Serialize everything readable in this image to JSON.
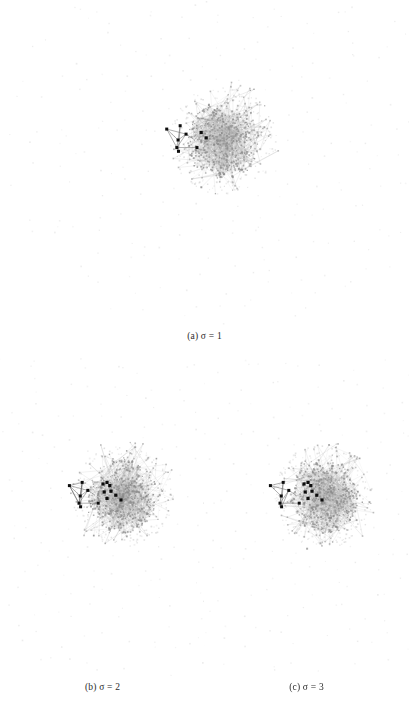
{
  "figure": {
    "background_color": "#ffffff",
    "panel_count": 3
  },
  "panels": [
    {
      "id": "a",
      "caption_label": "(a)",
      "caption_variable": "σ",
      "caption_value": "1",
      "caption_text": "(a) σ = 1",
      "highlighted_node_count": 6,
      "satellite_cluster_node_count": 6
    },
    {
      "id": "b",
      "caption_label": "(b)",
      "caption_variable": "σ",
      "caption_value": "2",
      "caption_text": "(b) σ = 2",
      "highlighted_node_count": 12,
      "satellite_cluster_node_count": 6
    },
    {
      "id": "c",
      "caption_label": "(c)",
      "caption_variable": "σ",
      "caption_value": "3",
      "caption_text": "(c) σ = 3",
      "highlighted_node_count": 12,
      "satellite_cluster_node_count": 6
    }
  ],
  "chart_data": {
    "type": "scatter",
    "title": "",
    "xlabel": "",
    "ylabel": "",
    "grid": false,
    "legend_position": "none",
    "axis_visible": false,
    "series": [
      {
        "name": "core cluster nodes",
        "color": "#8c8c8c",
        "values": [
          1
        ]
      },
      {
        "name": "core cluster edges",
        "color": "#a0a0a0",
        "values": [
          1
        ]
      },
      {
        "name": "highlighted nodes",
        "color": "#101010",
        "values": [
          1
        ]
      },
      {
        "name": "satellite cluster",
        "color": "#1a1a1a",
        "values": [
          1
        ]
      },
      {
        "name": "isolated ring nodes",
        "color": "#d2d2d2",
        "values": [
          1
        ]
      },
      {
        "name": "scattered isolated nodes",
        "color": "#e0e0e0",
        "values": [
          1
        ]
      }
    ],
    "panel_values": [
      {
        "panel": "a",
        "sigma": 1,
        "highlighted_nodes": 6
      },
      {
        "panel": "b",
        "sigma": 2,
        "highlighted_nodes": 12
      },
      {
        "panel": "c",
        "sigma": 3,
        "highlighted_nodes": 12
      }
    ]
  },
  "colors": {
    "background": "#ffffff",
    "core_node": "#8c8c8c",
    "core_edge": "#a8a8a8",
    "highlight_node": "#0d0d0d",
    "satellite_edge": "#555555",
    "ring_node": "#d4d4d4",
    "scatter_node": "#e2e2e2",
    "caption_text": "#2b2b2b"
  }
}
